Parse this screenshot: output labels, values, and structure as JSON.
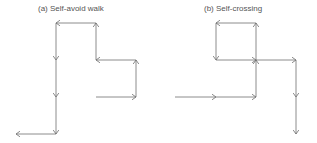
{
  "panels": [
    {
      "title": "(a) Self-avoid walk",
      "path": [
        [
          96,
          97
        ],
        [
          136,
          97
        ],
        [
          136,
          60
        ],
        [
          96,
          60
        ],
        [
          96,
          23
        ],
        [
          56,
          23
        ],
        [
          56,
          60
        ],
        [
          56,
          97
        ],
        [
          56,
          134
        ],
        [
          16,
          134
        ]
      ]
    },
    {
      "title": "(b) Self-crossing",
      "path": [
        [
          175,
          97
        ],
        [
          216,
          97
        ],
        [
          256,
          97
        ],
        [
          256,
          60
        ],
        [
          256,
          23
        ],
        [
          216,
          23
        ],
        [
          216,
          60
        ],
        [
          256,
          60
        ],
        [
          296,
          60
        ],
        [
          296,
          97
        ],
        [
          296,
          134
        ]
      ]
    }
  ],
  "colors": {
    "line": "#6e6e6e",
    "text": "#555555"
  }
}
